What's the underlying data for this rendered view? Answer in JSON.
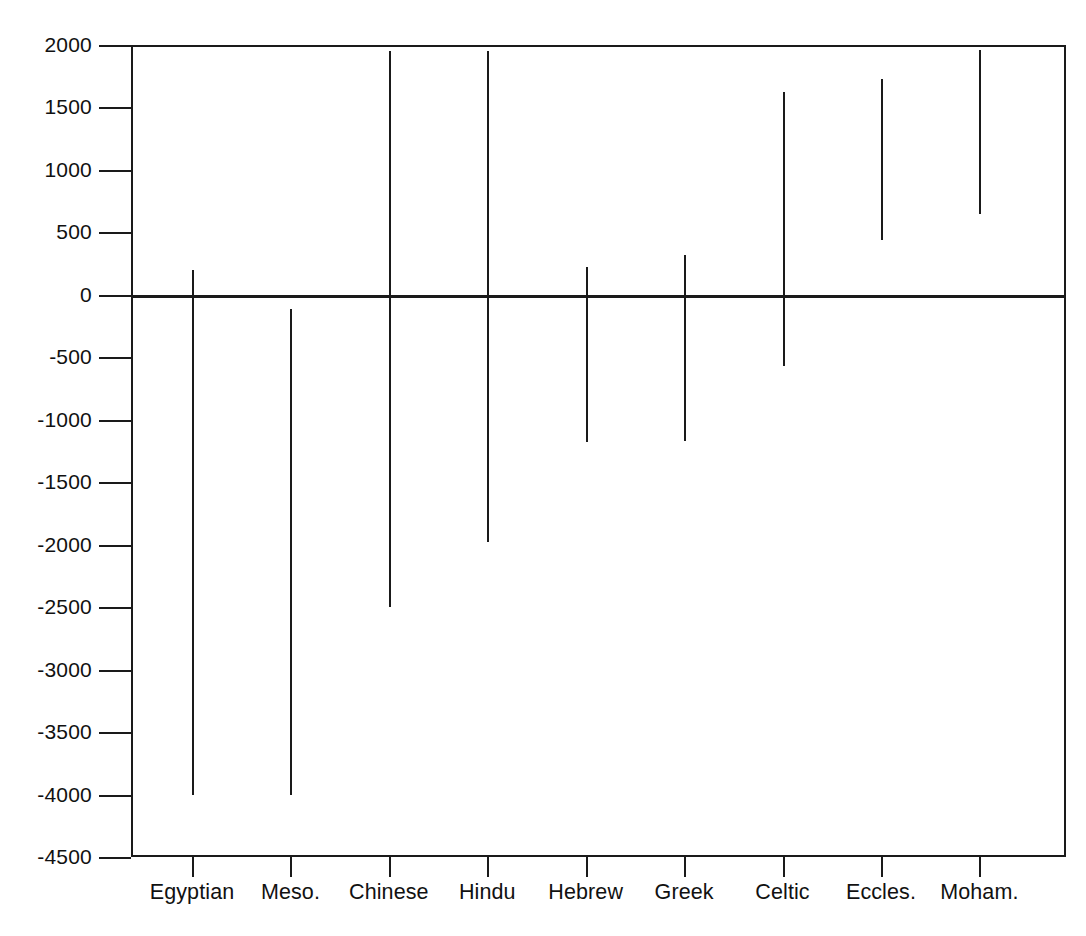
{
  "chart_data": {
    "type": "bar",
    "orientation": "vertical-range",
    "title": "",
    "subtitle": "",
    "xlabel": "",
    "ylabel": "",
    "ylim": [
      -4500,
      2000
    ],
    "grid": false,
    "legend": null,
    "categories": [
      "Egyptian",
      "Meso.",
      "Chinese",
      "Hindu",
      "Hebrew",
      "Greek",
      "Celtic",
      "Eccles.",
      "Moham."
    ],
    "yticks": [
      2000,
      1500,
      1000,
      500,
      0,
      -500,
      -1000,
      -1500,
      -2000,
      -2500,
      -3000,
      -3500,
      -4000,
      -4500
    ],
    "ytick_labels": [
      "2000",
      "1500",
      "1000",
      "500",
      "0",
      "-500",
      "-1000",
      "-1500",
      "-2000",
      "-2500",
      "-3000",
      "-3500",
      "-4000",
      "-4500"
    ],
    "series": [
      {
        "name": "Range",
        "ranges": [
          {
            "category": "Egyptian",
            "start": -4000,
            "end": 200
          },
          {
            "category": "Meso.",
            "start": -4000,
            "end": -110
          },
          {
            "category": "Chinese",
            "start": -2500,
            "end": 1950
          },
          {
            "category": "Hindu",
            "start": -1980,
            "end": 1950
          },
          {
            "category": "Hebrew",
            "start": -1180,
            "end": 220
          },
          {
            "category": "Greek",
            "start": -1170,
            "end": 320
          },
          {
            "category": "Celtic",
            "start": -570,
            "end": 1620
          },
          {
            "category": "Eccles.",
            "start": 440,
            "end": 1730
          },
          {
            "category": "Moham.",
            "start": 650,
            "end": 1960
          }
        ]
      }
    ],
    "zero_baseline": 0,
    "colors": {
      "bar": "#1a1a1a",
      "axis": "#1a1a1a",
      "background": "#ffffff"
    }
  },
  "axis": {
    "y_label_font_px": 21,
    "x_label_font_px": 21.5
  }
}
